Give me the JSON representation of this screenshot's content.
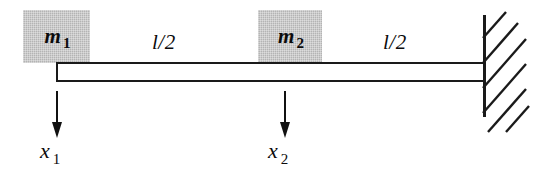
{
  "figure": {
    "background_color": "#ffffff",
    "line_color": "#1a1a1a",
    "mass_fill_color": "#b4b4b4"
  },
  "masses": [
    {
      "id": "m1",
      "symbol": "m",
      "subscript": "1",
      "x": 23,
      "y": 10,
      "width": 67,
      "height": 53
    },
    {
      "id": "m2",
      "symbol": "m",
      "subscript": "2",
      "x": 258,
      "y": 10,
      "width": 64,
      "height": 53
    }
  ],
  "beam": {
    "label": "beam",
    "x": 56,
    "y": 62,
    "width": 430,
    "height": 20
  },
  "segments": [
    {
      "id": "seg1",
      "label": "l/2",
      "x": 152,
      "y": 30
    },
    {
      "id": "seg2",
      "label": "l/2",
      "x": 383,
      "y": 30
    }
  ],
  "wall": {
    "label": "fixed-support-wall",
    "x": 483,
    "y": 15,
    "height": 102,
    "thickness": 3,
    "hatch_count": 6
  },
  "displacements": [
    {
      "id": "x1",
      "symbol": "x",
      "subscript": "1",
      "arrow_x": 57,
      "arrow_top": 92,
      "arrow_bottom": 136,
      "label_x": 40,
      "label_y": 138
    },
    {
      "id": "x2",
      "symbol": "x",
      "subscript": "2",
      "arrow_x": 285,
      "arrow_top": 92,
      "arrow_bottom": 136,
      "label_x": 268,
      "label_y": 138
    }
  ]
}
